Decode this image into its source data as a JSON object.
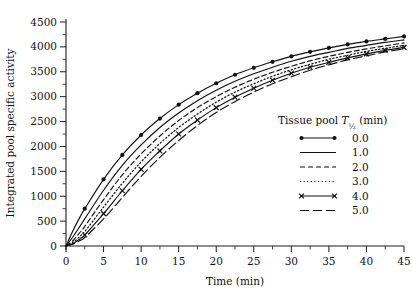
{
  "chart_data": {
    "type": "line",
    "title": "",
    "xlabel": "Time (min)",
    "ylabel": "Integrated pool specific activity",
    "xlim": [
      0,
      45
    ],
    "ylim": [
      0,
      4500
    ],
    "grid": false,
    "legend_position": "right-inside",
    "legend_title": "Tissue pool T½ (min)",
    "x_ticks": [
      0,
      5,
      10,
      15,
      20,
      25,
      30,
      35,
      40,
      45
    ],
    "x_tick_labels": [
      "0",
      "5",
      "10",
      "15",
      "20",
      "25",
      "30",
      "35",
      "40",
      "45"
    ],
    "x_minor_step": 2.5,
    "y_ticks": [
      0,
      500,
      1000,
      1500,
      2000,
      2500,
      3000,
      3500,
      4000,
      4500
    ],
    "y_tick_labels": [
      "0",
      "500",
      "1000",
      "1500",
      "2000",
      "2500",
      "3000",
      "3500",
      "4000",
      "4500"
    ],
    "y_minor_step": 250,
    "x": [
      0,
      1,
      2,
      2.5,
      5,
      7.5,
      10,
      12.5,
      15,
      17.5,
      20,
      22.5,
      25,
      27.5,
      30,
      32.5,
      35,
      37.5,
      40,
      42.5,
      45
    ],
    "series": [
      {
        "name": "0.0",
        "label": "0.0",
        "style": "solid",
        "marker": "circle",
        "values": [
          0,
          330,
          620,
          750,
          1340,
          1830,
          2230,
          2560,
          2840,
          3070,
          3270,
          3440,
          3580,
          3700,
          3810,
          3900,
          3980,
          4050,
          4110,
          4160,
          4210
        ]
      },
      {
        "name": "1.0",
        "label": "1.0",
        "style": "solid",
        "marker": "none",
        "values": [
          0,
          200,
          430,
          545,
          1120,
          1620,
          2030,
          2380,
          2670,
          2920,
          3130,
          3310,
          3460,
          3590,
          3710,
          3810,
          3890,
          3970,
          4030,
          4090,
          4140
        ]
      },
      {
        "name": "2.0",
        "label": "2.0",
        "style": "dashed",
        "marker": "none",
        "values": [
          0,
          120,
          300,
          395,
          930,
          1430,
          1850,
          2210,
          2520,
          2780,
          3000,
          3190,
          3350,
          3490,
          3610,
          3720,
          3810,
          3890,
          3960,
          4020,
          4080
        ]
      },
      {
        "name": "3.0",
        "label": "3.0",
        "style": "dotted",
        "marker": "none",
        "values": [
          0,
          80,
          215,
          290,
          780,
          1260,
          1690,
          2060,
          2380,
          2650,
          2890,
          3090,
          3260,
          3410,
          3540,
          3650,
          3750,
          3830,
          3910,
          3970,
          4030
        ]
      },
      {
        "name": "4.0",
        "label": "4.0",
        "style": "solid",
        "marker": "x",
        "values": [
          0,
          55,
          160,
          220,
          650,
          1110,
          1540,
          1910,
          2250,
          2530,
          2780,
          2990,
          3170,
          3330,
          3470,
          3590,
          3690,
          3780,
          3860,
          3930,
          3990
        ]
      },
      {
        "name": "5.0",
        "label": "5.0",
        "style": "longdash",
        "marker": "none",
        "values": [
          0,
          40,
          120,
          170,
          545,
          975,
          1400,
          1780,
          2120,
          2420,
          2680,
          2900,
          3090,
          3260,
          3400,
          3530,
          3640,
          3740,
          3820,
          3900,
          3960
        ]
      }
    ]
  },
  "legend": {
    "title": "Tissue pool T½ (min)",
    "title_main": "Tissue pool",
    "title_symbol": "T",
    "title_sub": "½",
    "title_unit": "(min)",
    "items": [
      {
        "label": "0.0",
        "style": "solid",
        "marker": "circle"
      },
      {
        "label": "1.0",
        "style": "solid",
        "marker": "none"
      },
      {
        "label": "2.0",
        "style": "dashed",
        "marker": "none"
      },
      {
        "label": "3.0",
        "style": "dotted",
        "marker": "none"
      },
      {
        "label": "4.0",
        "style": "solid",
        "marker": "x"
      },
      {
        "label": "5.0",
        "style": "longdash",
        "marker": "none"
      }
    ]
  },
  "axes": {
    "x_title": "Time (min)",
    "y_title": "Integrated pool specific activity"
  },
  "colors": {
    "ink": "#111111",
    "background": "#ffffff"
  }
}
